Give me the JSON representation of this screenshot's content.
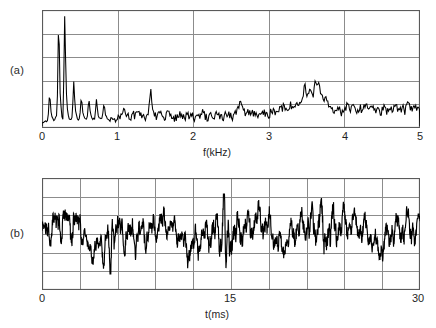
{
  "figure": {
    "background": "#ffffff",
    "trace_color": "#000000",
    "grid_color": "#8c8c8c",
    "frame_color": "#5a5a5a"
  },
  "panels": [
    {
      "id": "a",
      "label": "(a)",
      "axis_title": "f(kHz)",
      "x_ticks": [
        "0",
        "1",
        "2",
        "3",
        "4",
        "5"
      ]
    },
    {
      "id": "b",
      "label": "(b)",
      "axis_title": "t(ms)",
      "x_ticks": [
        "0",
        "15",
        "30"
      ]
    }
  ],
  "chart_data": [
    {
      "type": "line",
      "id": "spectrum",
      "title": "",
      "xlabel": "f(kHz)",
      "ylabel": "",
      "xlim": [
        0,
        5
      ],
      "ylim": [
        0,
        1
      ],
      "grid": true,
      "grid_cols": 5,
      "grid_rows": 5,
      "xticks": [
        0,
        1,
        2,
        3,
        4,
        5
      ],
      "xticklabels": [
        "0",
        "1",
        "2",
        "3",
        "4",
        "5"
      ],
      "yticklabels": [],
      "legend": "none",
      "annotations": [],
      "description": "Harmonic line spectrum of a voiced speech segment with noisy high-frequency floor and a formant bump near 3.5 kHz.",
      "x": [
        0.0,
        0.02,
        0.04,
        0.06,
        0.08,
        0.1,
        0.12,
        0.14,
        0.16,
        0.18,
        0.2,
        0.22,
        0.24,
        0.26,
        0.28,
        0.3,
        0.32,
        0.34,
        0.36,
        0.38,
        0.4,
        0.42,
        0.44,
        0.46,
        0.48,
        0.5,
        0.52,
        0.54,
        0.56,
        0.58,
        0.6,
        0.62,
        0.64,
        0.66,
        0.68,
        0.7,
        0.72,
        0.74,
        0.76,
        0.78,
        0.8,
        0.82,
        0.84,
        0.86,
        0.88,
        0.9,
        0.92,
        0.94,
        0.96,
        0.98,
        1.0,
        1.04,
        1.08,
        1.12,
        1.16,
        1.2,
        1.24,
        1.28,
        1.32,
        1.36,
        1.4,
        1.42,
        1.44,
        1.46,
        1.48,
        1.52,
        1.56,
        1.6,
        1.64,
        1.68,
        1.72,
        1.76,
        1.8,
        1.84,
        1.88,
        1.92,
        1.96,
        2.0,
        2.04,
        2.08,
        2.12,
        2.16,
        2.2,
        2.24,
        2.28,
        2.32,
        2.36,
        2.4,
        2.44,
        2.48,
        2.52,
        2.56,
        2.6,
        2.62,
        2.64,
        2.68,
        2.72,
        2.76,
        2.8,
        2.84,
        2.88,
        2.92,
        2.96,
        3.0,
        3.04,
        3.08,
        3.12,
        3.16,
        3.2,
        3.24,
        3.28,
        3.32,
        3.36,
        3.4,
        3.44,
        3.46,
        3.48,
        3.5,
        3.54,
        3.58,
        3.6,
        3.62,
        3.64,
        3.66,
        3.68,
        3.72,
        3.76,
        3.8,
        3.84,
        3.88,
        3.92,
        3.96,
        4.0,
        4.04,
        4.08,
        4.12,
        4.16,
        4.2,
        4.24,
        4.28,
        4.32,
        4.36,
        4.4,
        4.44,
        4.48,
        4.52,
        4.56,
        4.6,
        4.64,
        4.68,
        4.72,
        4.76,
        4.8,
        4.84,
        4.88,
        4.92,
        4.96,
        5.0
      ],
      "values": [
        0.02,
        0.03,
        0.05,
        0.04,
        0.06,
        0.3,
        0.12,
        0.06,
        0.05,
        0.07,
        0.1,
        1.0,
        0.3,
        0.08,
        0.06,
        0.97,
        0.34,
        0.1,
        0.07,
        0.06,
        0.08,
        0.4,
        0.14,
        0.08,
        0.06,
        0.07,
        0.26,
        0.12,
        0.07,
        0.06,
        0.08,
        0.25,
        0.11,
        0.07,
        0.06,
        0.07,
        0.23,
        0.1,
        0.07,
        0.06,
        0.08,
        0.2,
        0.1,
        0.07,
        0.06,
        0.05,
        0.08,
        0.06,
        0.05,
        0.06,
        0.07,
        0.09,
        0.13,
        0.08,
        0.07,
        0.1,
        0.08,
        0.12,
        0.09,
        0.07,
        0.11,
        0.17,
        0.34,
        0.16,
        0.09,
        0.07,
        0.1,
        0.08,
        0.09,
        0.12,
        0.08,
        0.07,
        0.09,
        0.11,
        0.07,
        0.08,
        0.1,
        0.08,
        0.07,
        0.09,
        0.12,
        0.08,
        0.07,
        0.09,
        0.08,
        0.1,
        0.07,
        0.08,
        0.11,
        0.09,
        0.08,
        0.12,
        0.18,
        0.22,
        0.16,
        0.11,
        0.13,
        0.1,
        0.12,
        0.09,
        0.11,
        0.13,
        0.1,
        0.09,
        0.14,
        0.11,
        0.16,
        0.13,
        0.18,
        0.15,
        0.19,
        0.16,
        0.2,
        0.17,
        0.22,
        0.3,
        0.4,
        0.26,
        0.3,
        0.24,
        0.34,
        0.42,
        0.33,
        0.38,
        0.3,
        0.26,
        0.22,
        0.18,
        0.15,
        0.13,
        0.16,
        0.12,
        0.14,
        0.18,
        0.13,
        0.16,
        0.12,
        0.17,
        0.13,
        0.18,
        0.14,
        0.19,
        0.13,
        0.17,
        0.12,
        0.16,
        0.13,
        0.18,
        0.14,
        0.17,
        0.12,
        0.16,
        0.13,
        0.18,
        0.14,
        0.19,
        0.13,
        0.17,
        0.14,
        0.12
      ]
    },
    {
      "type": "line",
      "id": "waveform",
      "title": "",
      "xlabel": "t(ms)",
      "ylabel": "",
      "xlim": [
        0,
        30
      ],
      "ylim": [
        -1,
        1
      ],
      "grid": true,
      "grid_cols": 10,
      "grid_rows": 6,
      "xticks": [
        0,
        15,
        30
      ],
      "xticklabels": [
        "0",
        "15",
        "30"
      ],
      "yticklabels": [],
      "legend": "none",
      "annotations": [],
      "description": "Time-domain speech pressure waveform over 30 ms with quasi-periodic structure and large transient excursions near 5.5 ms and 14.5 ms."
    }
  ]
}
